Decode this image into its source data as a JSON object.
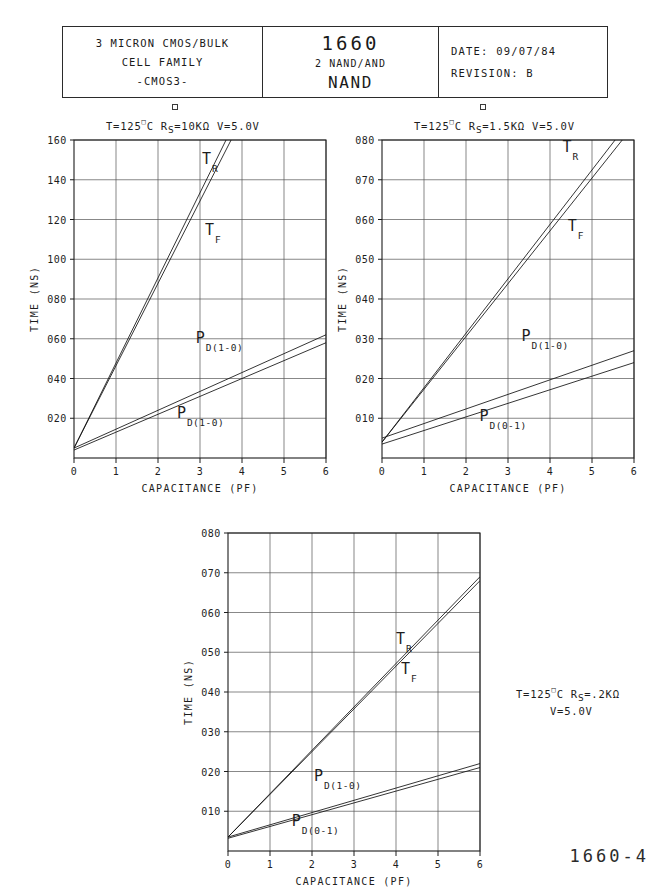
{
  "title_block": {
    "family": {
      "line1": "3 MICRON CMOS/BULK",
      "line2": "CELL FAMILY",
      "line3": "-CMOS3-"
    },
    "part": {
      "number": "1660",
      "description": "2 NAND/AND",
      "name": "NAND"
    },
    "revision": {
      "date_label": "DATE:",
      "date_value": "09/07/84",
      "revision_label": "REVISION:",
      "revision_value": "B"
    }
  },
  "footer": {
    "page_code": "1660-4"
  },
  "chart_data": [
    {
      "id": "chart-1",
      "type": "line",
      "title": "T=125°C  R S=10KΩ  V=5.0V",
      "conditions": {
        "temperature": "T=125",
        "degree": "o",
        "temp_unit": "C",
        "resistance_prefix": "R",
        "resistance_sub": "S",
        "resistance_value": "=10KΩ",
        "voltage": "V=5.0V"
      },
      "xlabel": "CAPACITANCE (PF)",
      "ylabel": "TIME (NS)",
      "xlim": [
        0,
        6
      ],
      "ylim": [
        0,
        160
      ],
      "xticks": [
        "0",
        "1",
        "2",
        "3",
        "4",
        "5",
        "6"
      ],
      "yticks": [
        "020",
        "040",
        "060",
        "080",
        "100",
        "120",
        "140",
        "160"
      ],
      "ytick_values": [
        20,
        40,
        60,
        80,
        100,
        120,
        140,
        160
      ],
      "grid": true,
      "series": [
        {
          "name": "T_R",
          "label_main": "T",
          "label_sub": "R",
          "x": [
            0,
            3.62
          ],
          "y": [
            5,
            160
          ],
          "label_x": 3.05,
          "label_y": 148
        },
        {
          "name": "T_F",
          "label_main": "T",
          "label_sub": "F",
          "x": [
            0,
            3.74
          ],
          "y": [
            5,
            160
          ],
          "label_x": 3.12,
          "label_y": 112
        },
        {
          "name": "P_D(1-0)-upper",
          "label_main": "P",
          "label_sub": "D(1-0)",
          "x": [
            0,
            6
          ],
          "y": [
            5,
            62
          ],
          "label_x": 2.9,
          "label_y": 58
        },
        {
          "name": "P_D(1-0)-lower",
          "label_main": "P",
          "label_sub": "D(1-0)",
          "x": [
            0,
            6
          ],
          "y": [
            4,
            58
          ],
          "label_x": 2.45,
          "label_y": 20
        }
      ]
    },
    {
      "id": "chart-2",
      "type": "line",
      "title": "T=125°C  R S=1.5KΩ  V=5.0V",
      "conditions": {
        "temperature": "T=125",
        "degree": "o",
        "temp_unit": "C",
        "resistance_prefix": "R",
        "resistance_sub": "S",
        "resistance_value": "=1.5KΩ",
        "voltage": "V=5.0V"
      },
      "xlabel": "CAPACITANCE (PF)",
      "ylabel": "TIME (NS)",
      "xlim": [
        0,
        6
      ],
      "ylim": [
        0,
        80
      ],
      "xticks": [
        "0",
        "1",
        "2",
        "3",
        "4",
        "5",
        "6"
      ],
      "yticks": [
        "010",
        "020",
        "030",
        "040",
        "050",
        "060",
        "070",
        "080"
      ],
      "ytick_values": [
        10,
        20,
        30,
        40,
        50,
        60,
        70,
        80
      ],
      "grid": true,
      "series": [
        {
          "name": "T_R",
          "label_main": "T",
          "label_sub": "R",
          "x": [
            0,
            5.55
          ],
          "y": [
            4,
            80
          ],
          "label_x": 4.3,
          "label_y": 77
        },
        {
          "name": "T_F",
          "label_main": "T",
          "label_sub": "F",
          "x": [
            0,
            5.72
          ],
          "y": [
            4,
            80
          ],
          "label_x": 4.42,
          "label_y": 57
        },
        {
          "name": "P_D(1-0)",
          "label_main": "P",
          "label_sub": "D(1-0)",
          "x": [
            0,
            6
          ],
          "y": [
            5,
            27
          ],
          "label_x": 3.32,
          "label_y": 29.5
        },
        {
          "name": "P_D(0-1)",
          "label_main": "P",
          "label_sub": "D(0-1)",
          "x": [
            0,
            6
          ],
          "y": [
            3.5,
            24
          ],
          "label_x": 2.32,
          "label_y": 9.2
        }
      ]
    },
    {
      "id": "chart-3",
      "type": "line",
      "title": "T=125°C  R S=.2KΩ  V=5.0V",
      "conditions": {
        "temperature": "T=125",
        "degree": "o",
        "temp_unit": "C",
        "resistance_prefix": "R",
        "resistance_sub": "S",
        "resistance_value": "=.2KΩ",
        "voltage": "V=5.0V"
      },
      "xlabel": "CAPACITANCE (PF)",
      "ylabel": "TIME (NS)",
      "xlim": [
        0,
        6
      ],
      "ylim": [
        0,
        80
      ],
      "xticks": [
        "0",
        "1",
        "2",
        "3",
        "4",
        "5",
        "6"
      ],
      "yticks": [
        "010",
        "020",
        "030",
        "040",
        "050",
        "060",
        "070",
        "080"
      ],
      "ytick_values": [
        10,
        20,
        30,
        40,
        50,
        60,
        70,
        80
      ],
      "grid": true,
      "series": [
        {
          "name": "T_R",
          "label_main": "T",
          "label_sub": "R",
          "x": [
            0,
            6
          ],
          "y": [
            3.5,
            69
          ],
          "label_x": 4.0,
          "label_y": 52
        },
        {
          "name": "T_F",
          "label_main": "T",
          "label_sub": "F",
          "x": [
            0,
            6
          ],
          "y": [
            3.5,
            68
          ],
          "label_x": 4.12,
          "label_y": 44.5
        },
        {
          "name": "P_D(1-0)",
          "label_main": "P",
          "label_sub": "D(1-0)",
          "x": [
            0,
            6
          ],
          "y": [
            3.5,
            22
          ],
          "label_x": 2.05,
          "label_y": 17.5
        },
        {
          "name": "P_D(0-1)",
          "label_main": "P",
          "label_sub": "D(0-1)",
          "x": [
            0,
            6
          ],
          "y": [
            3.2,
            21
          ],
          "label_x": 1.52,
          "label_y": 6.2
        }
      ]
    }
  ]
}
